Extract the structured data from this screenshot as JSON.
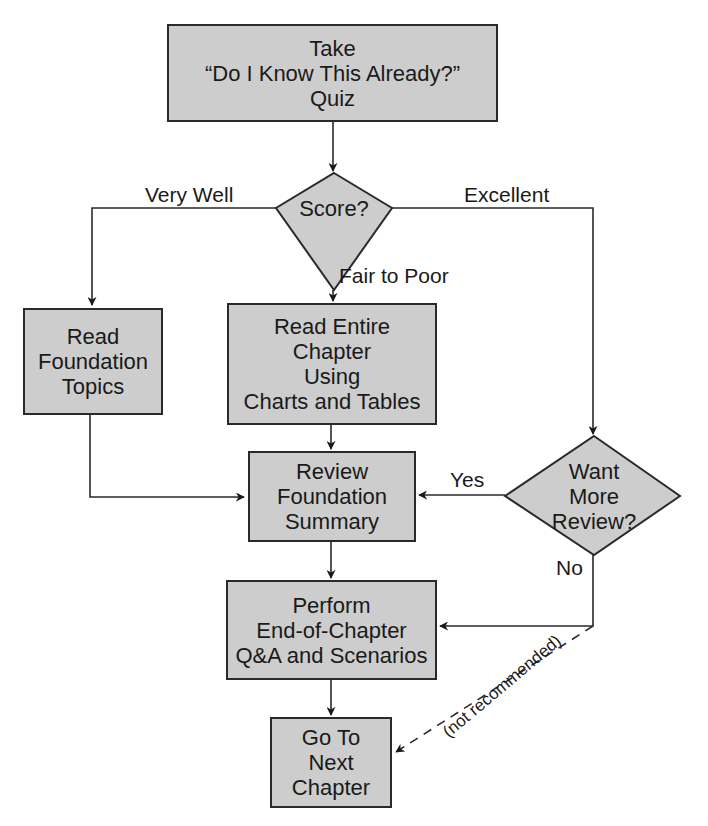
{
  "diagram": {
    "type": "flowchart",
    "colors": {
      "node_fill": "#cdcdcd",
      "stroke": "#2a2a2a",
      "background": "#ffffff"
    },
    "nodes": {
      "quiz": {
        "lines": [
          "Take",
          "“Do I Know This Already?”",
          "Quiz"
        ]
      },
      "score": {
        "lines": [
          "Score?"
        ]
      },
      "read_topics": {
        "lines": [
          "Read",
          "Foundation",
          "Topics"
        ]
      },
      "read_chapter": {
        "lines": [
          "Read Entire",
          "Chapter",
          "Using",
          "Charts and Tables"
        ]
      },
      "review_summary": {
        "lines": [
          "Review",
          "Foundation",
          "Summary"
        ]
      },
      "want_more": {
        "lines": [
          "Want",
          "More",
          "Review?"
        ]
      },
      "perform_qa": {
        "lines": [
          "Perform",
          "End-of-Chapter",
          "Q&A and Scenarios"
        ]
      },
      "next_chapter": {
        "lines": [
          "Go To",
          "Next",
          "Chapter"
        ]
      }
    },
    "edge_labels": {
      "very_well": "Very Well",
      "excellent": "Excellent",
      "fair_to_poor": "Fair to Poor",
      "yes": "Yes",
      "no": "No",
      "not_recommended": "(not recommended)"
    },
    "edges": [
      {
        "from": "quiz",
        "to": "score"
      },
      {
        "from": "score",
        "to": "read_topics",
        "label": "Very Well"
      },
      {
        "from": "score",
        "to": "read_chapter",
        "label": "Fair to Poor"
      },
      {
        "from": "score",
        "to": "want_more",
        "label": "Excellent"
      },
      {
        "from": "read_topics",
        "to": "review_summary"
      },
      {
        "from": "read_chapter",
        "to": "review_summary"
      },
      {
        "from": "want_more",
        "to": "review_summary",
        "label": "Yes"
      },
      {
        "from": "want_more",
        "to": "perform_qa",
        "label": "No"
      },
      {
        "from": "want_more",
        "to": "next_chapter",
        "label": "(not recommended)",
        "style": "dashed"
      },
      {
        "from": "review_summary",
        "to": "perform_qa"
      },
      {
        "from": "perform_qa",
        "to": "next_chapter"
      }
    ]
  }
}
